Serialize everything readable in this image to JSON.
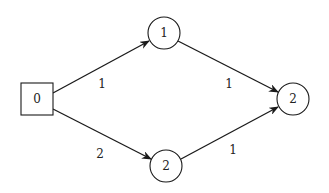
{
  "diagram": {
    "type": "directed-graph",
    "nodes": [
      {
        "id": "n0",
        "label": "0",
        "shape": "square",
        "cx": 37,
        "cy": 99,
        "size": 32
      },
      {
        "id": "n1",
        "label": "1",
        "shape": "circle",
        "cx": 164,
        "cy": 33,
        "r": 16
      },
      {
        "id": "n2b",
        "label": "2",
        "shape": "circle",
        "cx": 166,
        "cy": 166,
        "r": 16
      },
      {
        "id": "n2r",
        "label": "2",
        "shape": "circle",
        "cx": 293,
        "cy": 99,
        "r": 16
      }
    ],
    "edges": [
      {
        "from": "n0",
        "to": "n1",
        "label": "1",
        "x1": 53,
        "y1": 93,
        "x2": 149,
        "y2": 41,
        "lx": 102,
        "ly": 84
      },
      {
        "from": "n1",
        "to": "n2r",
        "label": "1",
        "x1": 178,
        "y1": 41,
        "x2": 278,
        "y2": 92,
        "lx": 229,
        "ly": 84
      },
      {
        "from": "n0",
        "to": "n2b",
        "label": "2",
        "x1": 53,
        "y1": 109,
        "x2": 151,
        "y2": 159,
        "lx": 100,
        "ly": 154
      },
      {
        "from": "n2b",
        "to": "n2r",
        "label": "1",
        "x1": 181,
        "y1": 159,
        "x2": 278,
        "y2": 107,
        "lx": 233,
        "ly": 150
      }
    ],
    "colors": {
      "stroke": "#1a1a1a",
      "text": "#222222",
      "background": "#ffffff"
    }
  }
}
